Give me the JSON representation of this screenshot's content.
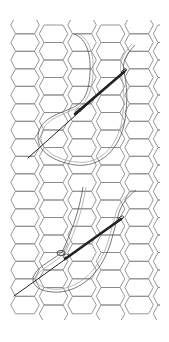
{
  "illustration": {
    "title": "Needle and thread stitching on hexagon mesh",
    "colors": {
      "background": "#ffffff",
      "grid": "#8a8a8a",
      "thread": "#555555",
      "needle": "#222222"
    },
    "grid": {
      "type": "hexagon-mesh"
    },
    "figures": [
      {
        "name": "upper-stitch",
        "description": "Needle passing diagonally through mesh with looped thread"
      },
      {
        "name": "lower-stitch",
        "description": "Needle passing through a knot loop with looped thread"
      }
    ]
  }
}
